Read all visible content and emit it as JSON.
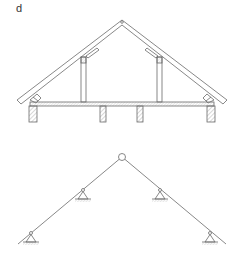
{
  "figure": {
    "panel_label": "d",
    "colors": {
      "line": "#6a6a6a",
      "hatch": "#9a9a9a",
      "background": "#ffffff"
    },
    "roof_section": {
      "description": "Pitched roof cross-section with rafters, collar studs, ceiling joist and walls",
      "apex": [
        122,
        22
      ],
      "rafter_left_end": [
        18,
        104
      ],
      "rafter_right_end": [
        226,
        104
      ],
      "ceiling_joist": {
        "x1": 30,
        "x2": 214,
        "y": 102,
        "height": 4
      },
      "walls": [
        {
          "x": 29,
          "y": 106,
          "w": 8,
          "h": 16
        },
        {
          "x": 207,
          "y": 106,
          "w": 8,
          "h": 16
        }
      ],
      "interior_posts": [
        {
          "x": 100,
          "y": 106,
          "w": 6,
          "h": 16
        },
        {
          "x": 137,
          "y": 106,
          "w": 6,
          "h": 16
        }
      ],
      "studs": [
        {
          "x": 81,
          "y": 57,
          "w": 5,
          "h": 45
        },
        {
          "x": 157,
          "y": 57,
          "w": 5,
          "h": 45
        }
      ]
    },
    "structural_model": {
      "description": "Static model: two inclined members joined by hinge at apex, supported on four pinned supports",
      "hinge": {
        "cx": 122,
        "cy": 157,
        "r": 3.5
      },
      "member_left": {
        "from": [
          119,
          159
        ],
        "to": [
          18,
          244
        ]
      },
      "member_right": {
        "from": [
          125,
          159
        ],
        "to": [
          226,
          244
        ]
      },
      "supports": [
        {
          "x": 31,
          "y": 233
        },
        {
          "x": 83,
          "y": 190
        },
        {
          "x": 160,
          "y": 190
        },
        {
          "x": 210,
          "y": 233
        }
      ]
    }
  }
}
